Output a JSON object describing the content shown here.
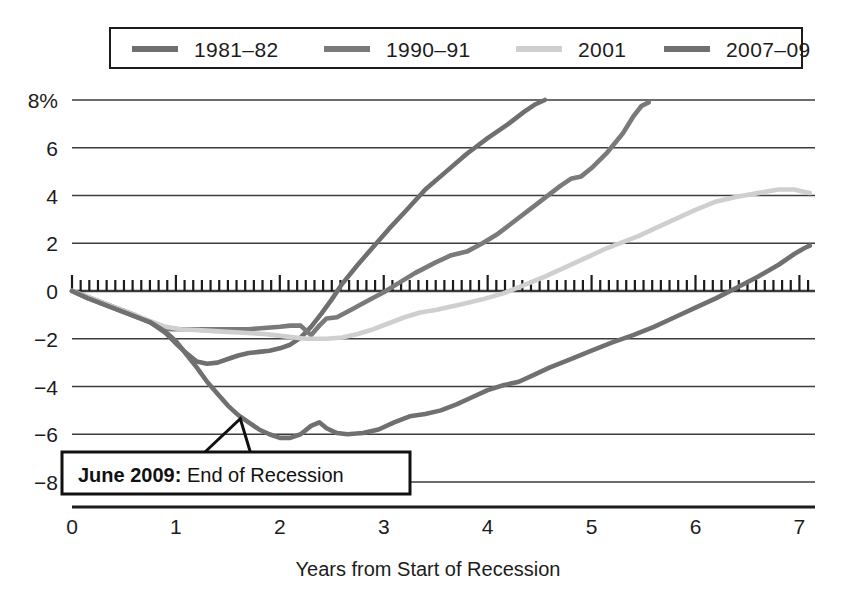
{
  "chart_data": {
    "type": "line",
    "title": "",
    "xlabel": "Years from Start of Recession",
    "ylabel": "",
    "xlim": [
      0,
      7.15
    ],
    "ylim": [
      -8.6,
      8.8
    ],
    "grid": true,
    "legend_position": "top",
    "x_ticks": [
      "0",
      "1",
      "2",
      "3",
      "4",
      "5",
      "6",
      "7"
    ],
    "x_tick_values": [
      0,
      1,
      2,
      3,
      4,
      5,
      6,
      7
    ],
    "y_ticks": [
      "8%",
      "6",
      "4",
      "2",
      "0",
      "−2",
      "−4",
      "−6",
      "−8"
    ],
    "y_tick_values": [
      8,
      6,
      4,
      2,
      0,
      -2,
      -4,
      -6,
      -8
    ],
    "minor_ticks_on_zero_axis": true,
    "series": [
      {
        "name": "1981–82",
        "color": "#6f6f6f",
        "points": [
          [
            0.0,
            0.0
          ],
          [
            0.15,
            -0.25
          ],
          [
            0.3,
            -0.5
          ],
          [
            0.45,
            -0.75
          ],
          [
            0.6,
            -1.0
          ],
          [
            0.75,
            -1.3
          ],
          [
            0.9,
            -1.75
          ],
          [
            1.0,
            -2.2
          ],
          [
            1.1,
            -2.6
          ],
          [
            1.2,
            -2.95
          ],
          [
            1.3,
            -3.05
          ],
          [
            1.4,
            -3.0
          ],
          [
            1.5,
            -2.85
          ],
          [
            1.6,
            -2.7
          ],
          [
            1.7,
            -2.6
          ],
          [
            1.8,
            -2.55
          ],
          [
            1.9,
            -2.5
          ],
          [
            2.0,
            -2.4
          ],
          [
            2.1,
            -2.25
          ],
          [
            2.2,
            -1.95
          ],
          [
            2.3,
            -1.5
          ],
          [
            2.4,
            -0.95
          ],
          [
            2.5,
            -0.35
          ],
          [
            2.6,
            0.3
          ],
          [
            2.75,
            1.1
          ],
          [
            2.9,
            1.85
          ],
          [
            3.05,
            2.6
          ],
          [
            3.2,
            3.3
          ],
          [
            3.4,
            4.25
          ],
          [
            3.6,
            5.0
          ],
          [
            3.8,
            5.75
          ],
          [
            4.0,
            6.4
          ],
          [
            4.2,
            7.0
          ],
          [
            4.35,
            7.5
          ],
          [
            4.45,
            7.8
          ],
          [
            4.55,
            8.0
          ]
        ]
      },
      {
        "name": "1990–91",
        "color": "#7a7a7a",
        "points": [
          [
            0.0,
            0.0
          ],
          [
            0.15,
            -0.3
          ],
          [
            0.3,
            -0.55
          ],
          [
            0.45,
            -0.8
          ],
          [
            0.6,
            -1.05
          ],
          [
            0.75,
            -1.3
          ],
          [
            0.85,
            -1.5
          ],
          [
            0.95,
            -1.6
          ],
          [
            1.1,
            -1.6
          ],
          [
            1.3,
            -1.6
          ],
          [
            1.5,
            -1.6
          ],
          [
            1.7,
            -1.6
          ],
          [
            1.85,
            -1.55
          ],
          [
            2.0,
            -1.5
          ],
          [
            2.1,
            -1.45
          ],
          [
            2.2,
            -1.45
          ],
          [
            2.3,
            -1.85
          ],
          [
            2.38,
            -1.45
          ],
          [
            2.45,
            -1.15
          ],
          [
            2.55,
            -1.1
          ],
          [
            2.7,
            -0.75
          ],
          [
            2.85,
            -0.4
          ],
          [
            3.0,
            -0.05
          ],
          [
            3.15,
            0.35
          ],
          [
            3.3,
            0.75
          ],
          [
            3.5,
            1.2
          ],
          [
            3.65,
            1.5
          ],
          [
            3.8,
            1.65
          ],
          [
            3.95,
            2.0
          ],
          [
            4.1,
            2.4
          ],
          [
            4.25,
            2.9
          ],
          [
            4.4,
            3.4
          ],
          [
            4.55,
            3.9
          ],
          [
            4.7,
            4.4
          ],
          [
            4.8,
            4.7
          ],
          [
            4.9,
            4.8
          ],
          [
            5.0,
            5.15
          ],
          [
            5.15,
            5.8
          ],
          [
            5.3,
            6.6
          ],
          [
            5.4,
            7.3
          ],
          [
            5.48,
            7.75
          ],
          [
            5.55,
            7.9
          ]
        ]
      },
      {
        "name": "2001",
        "color": "#cfcfcf",
        "points": [
          [
            0.0,
            0.0
          ],
          [
            0.15,
            -0.25
          ],
          [
            0.3,
            -0.5
          ],
          [
            0.45,
            -0.75
          ],
          [
            0.6,
            -1.0
          ],
          [
            0.75,
            -1.25
          ],
          [
            0.9,
            -1.5
          ],
          [
            1.05,
            -1.6
          ],
          [
            1.25,
            -1.65
          ],
          [
            1.45,
            -1.7
          ],
          [
            1.65,
            -1.75
          ],
          [
            1.85,
            -1.8
          ],
          [
            2.05,
            -1.9
          ],
          [
            2.25,
            -2.0
          ],
          [
            2.45,
            -2.0
          ],
          [
            2.6,
            -1.95
          ],
          [
            2.75,
            -1.8
          ],
          [
            2.9,
            -1.6
          ],
          [
            3.05,
            -1.35
          ],
          [
            3.2,
            -1.1
          ],
          [
            3.35,
            -0.9
          ],
          [
            3.5,
            -0.8
          ],
          [
            3.65,
            -0.65
          ],
          [
            3.8,
            -0.5
          ],
          [
            3.95,
            -0.35
          ],
          [
            4.15,
            -0.1
          ],
          [
            4.35,
            0.25
          ],
          [
            4.55,
            0.6
          ],
          [
            4.75,
            1.0
          ],
          [
            4.95,
            1.4
          ],
          [
            5.15,
            1.8
          ],
          [
            5.3,
            2.05
          ],
          [
            5.45,
            2.3
          ],
          [
            5.6,
            2.6
          ],
          [
            5.8,
            3.0
          ],
          [
            6.0,
            3.4
          ],
          [
            6.2,
            3.75
          ],
          [
            6.4,
            3.95
          ],
          [
            6.6,
            4.1
          ],
          [
            6.8,
            4.25
          ],
          [
            6.95,
            4.25
          ],
          [
            7.05,
            4.15
          ],
          [
            7.1,
            4.1
          ]
        ]
      },
      {
        "name": "2007–09",
        "color": "#707070",
        "points": [
          [
            0.0,
            0.0
          ],
          [
            0.15,
            -0.3
          ],
          [
            0.3,
            -0.55
          ],
          [
            0.45,
            -0.8
          ],
          [
            0.6,
            -1.05
          ],
          [
            0.75,
            -1.3
          ],
          [
            0.9,
            -1.7
          ],
          [
            1.0,
            -2.1
          ],
          [
            1.1,
            -2.65
          ],
          [
            1.2,
            -3.2
          ],
          [
            1.3,
            -3.8
          ],
          [
            1.4,
            -4.3
          ],
          [
            1.5,
            -4.8
          ],
          [
            1.6,
            -5.2
          ],
          [
            1.7,
            -5.5
          ],
          [
            1.8,
            -5.8
          ],
          [
            1.9,
            -6.0
          ],
          [
            2.0,
            -6.15
          ],
          [
            2.1,
            -6.15
          ],
          [
            2.2,
            -6.0
          ],
          [
            2.3,
            -5.65
          ],
          [
            2.38,
            -5.5
          ],
          [
            2.45,
            -5.75
          ],
          [
            2.55,
            -5.95
          ],
          [
            2.65,
            -6.0
          ],
          [
            2.8,
            -5.95
          ],
          [
            2.95,
            -5.8
          ],
          [
            3.1,
            -5.5
          ],
          [
            3.25,
            -5.25
          ],
          [
            3.4,
            -5.15
          ],
          [
            3.55,
            -5.0
          ],
          [
            3.7,
            -4.75
          ],
          [
            3.85,
            -4.45
          ],
          [
            4.0,
            -4.15
          ],
          [
            4.15,
            -3.95
          ],
          [
            4.3,
            -3.8
          ],
          [
            4.45,
            -3.5
          ],
          [
            4.6,
            -3.2
          ],
          [
            4.8,
            -2.85
          ],
          [
            5.0,
            -2.5
          ],
          [
            5.2,
            -2.15
          ],
          [
            5.4,
            -1.85
          ],
          [
            5.6,
            -1.5
          ],
          [
            5.8,
            -1.1
          ],
          [
            6.0,
            -0.7
          ],
          [
            6.2,
            -0.3
          ],
          [
            6.4,
            0.15
          ],
          [
            6.6,
            0.6
          ],
          [
            6.8,
            1.1
          ],
          [
            6.95,
            1.55
          ],
          [
            7.05,
            1.8
          ],
          [
            7.1,
            1.9
          ]
        ]
      }
    ],
    "annotations": [
      {
        "name": "end-of-recession-callout",
        "bold_text": "June 2009:",
        "plain_text": " End of Recession",
        "pointer_x": 1.62,
        "pointer_y": -5.35
      }
    ]
  },
  "legend": {
    "items": [
      {
        "label": "1981–82",
        "color": "#6f6f6f"
      },
      {
        "label": "1990–91",
        "color": "#7a7a7a"
      },
      {
        "label": "2001",
        "color": "#cfcfcf"
      },
      {
        "label": "2007–09",
        "color": "#707070"
      }
    ]
  },
  "axes": {
    "x_title": "Years from Start of Recession"
  },
  "colors": {
    "grid": "#3d3d3d",
    "axis": "#1c1c1c",
    "background": "#ffffff",
    "callout_border": "#111111",
    "callout_fill": "#ffffff"
  }
}
